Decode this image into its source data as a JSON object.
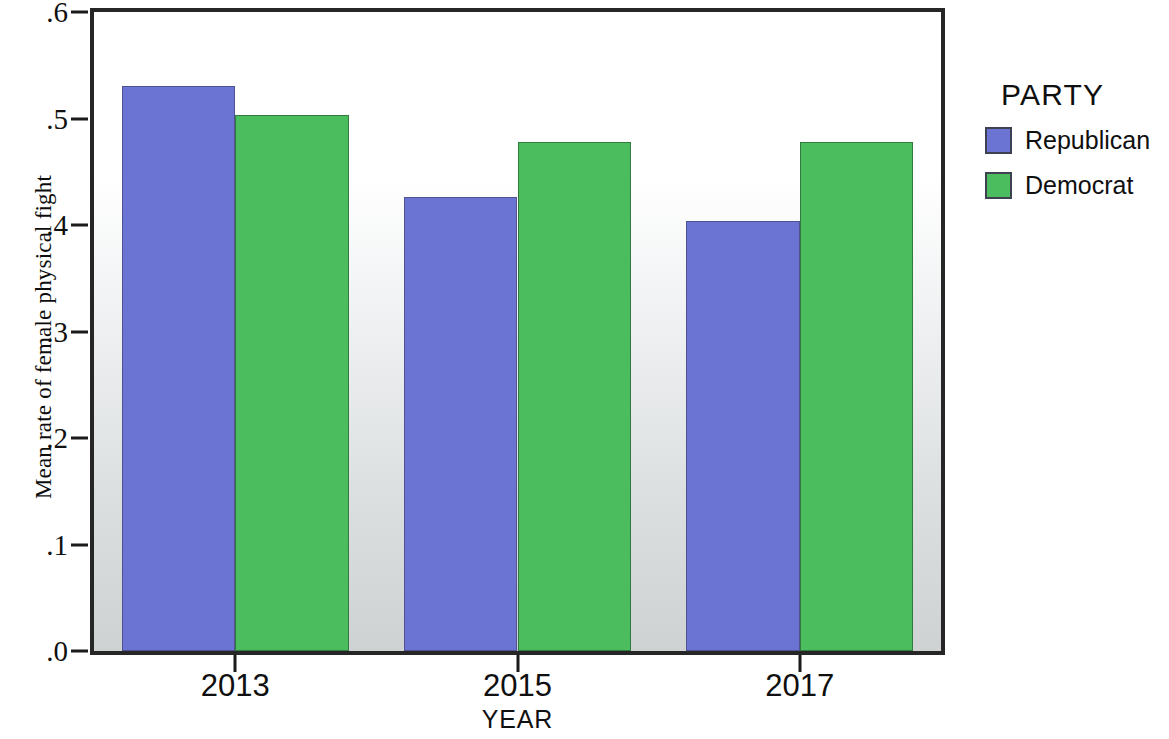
{
  "chart_data": {
    "type": "bar",
    "title": "",
    "xlabel": "YEAR",
    "ylabel": "Mean rate of female physical fight",
    "categories": [
      "2013",
      "2015",
      "2017"
    ],
    "series": [
      {
        "name": "Republican",
        "color": "#6b74d2",
        "values": [
          0.531,
          0.426,
          0.404
        ]
      },
      {
        "name": "Democrat",
        "color": "#4cbd5e",
        "values": [
          0.503,
          0.478,
          0.478
        ]
      }
    ],
    "ylim": [
      0.0,
      0.6
    ],
    "ytick_values": [
      0.0,
      0.1,
      0.2,
      0.3,
      0.4,
      0.5,
      0.6
    ],
    "ytick_labels": [
      ".0",
      ".1",
      ".2",
      ".3",
      ".4",
      ".5",
      ".6"
    ],
    "grid": false,
    "legend_position": "right",
    "legend_title": "PARTY"
  },
  "legend": {
    "title": "PARTY",
    "entries": [
      {
        "label": "Republican",
        "color": "#6b74d2"
      },
      {
        "label": "Democrat",
        "color": "#4cbd5e"
      }
    ]
  },
  "axes": {
    "x_title": "YEAR",
    "y_title": "Mean rate of female physical fight"
  }
}
